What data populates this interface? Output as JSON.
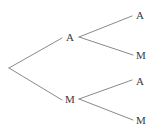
{
  "figure": {
    "type": "binary-tree-diagram",
    "width": 167,
    "height": 139,
    "background_color": "#ffffff",
    "edge_color": "#8a8a8a",
    "edge_width": 1,
    "label_color": "#3a3a3a",
    "label_font_size": 11
  },
  "tree": {
    "nodes": [
      {
        "id": "root",
        "label": "",
        "x": 9,
        "y": 68,
        "depth": 0,
        "kind": "root"
      },
      {
        "id": "n-a",
        "label": "A",
        "x": 70,
        "y": 37,
        "depth": 1,
        "kind": "internal"
      },
      {
        "id": "n-m",
        "label": "M",
        "x": 70,
        "y": 99,
        "depth": 1,
        "kind": "internal"
      },
      {
        "id": "leaf-aa",
        "label": "A",
        "x": 140,
        "y": 15,
        "depth": 2,
        "kind": "leaf"
      },
      {
        "id": "leaf-am",
        "label": "M",
        "x": 141,
        "y": 55,
        "depth": 2,
        "kind": "leaf"
      },
      {
        "id": "leaf-ma",
        "label": "A",
        "x": 140,
        "y": 81,
        "depth": 2,
        "kind": "leaf"
      },
      {
        "id": "leaf-mm",
        "label": "M",
        "x": 141,
        "y": 120,
        "depth": 2,
        "kind": "leaf"
      }
    ],
    "edges": [
      {
        "id": "edge-root-a",
        "from": "root",
        "to": "n-a",
        "x1": 9,
        "y1": 68,
        "x2": 62,
        "y2": 38
      },
      {
        "id": "edge-root-m",
        "from": "root",
        "to": "n-m",
        "x1": 9,
        "y1": 68,
        "x2": 62,
        "y2": 100
      },
      {
        "id": "edge-a-aa",
        "from": "n-a",
        "to": "leaf-aa",
        "x1": 79,
        "y1": 37,
        "x2": 132,
        "y2": 16
      },
      {
        "id": "edge-a-am",
        "from": "n-a",
        "to": "leaf-am",
        "x1": 79,
        "y1": 37,
        "x2": 133,
        "y2": 55
      },
      {
        "id": "edge-m-ma",
        "from": "n-m",
        "to": "leaf-ma",
        "x1": 79,
        "y1": 99,
        "x2": 132,
        "y2": 80
      },
      {
        "id": "edge-m-mm",
        "from": "n-m",
        "to": "leaf-mm",
        "x1": 79,
        "y1": 99,
        "x2": 133,
        "y2": 120
      }
    ]
  }
}
